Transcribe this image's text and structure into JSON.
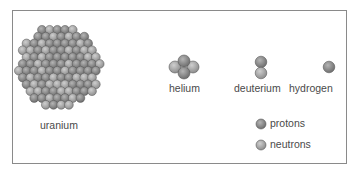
{
  "diagram": {
    "nuclei": [
      {
        "name": "uranium",
        "label": "uranium"
      },
      {
        "name": "helium",
        "label": "helium"
      },
      {
        "name": "deuterium",
        "label": "deuterium"
      },
      {
        "name": "hydrogen",
        "label": "hydrogen"
      }
    ],
    "legend": [
      {
        "label": "protons",
        "color": "#8a8a8a"
      },
      {
        "label": "neutrons",
        "color": "#a9a9a9"
      }
    ]
  }
}
